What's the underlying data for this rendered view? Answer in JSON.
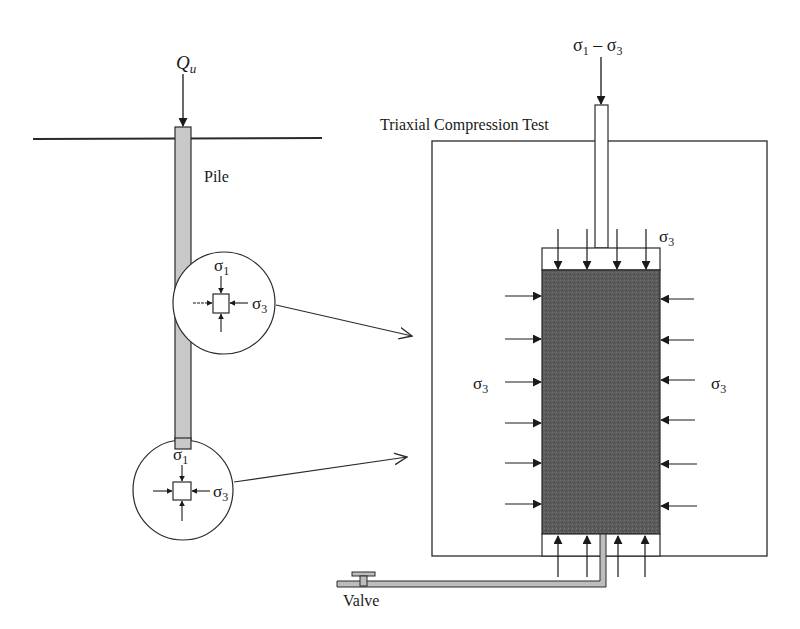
{
  "diagram": {
    "load_label": "Q",
    "load_subscript": "u",
    "pile_label": "Pile",
    "test_title": "Triaxial Compression Test",
    "deviator_label": {
      "s1": "σ",
      "s1_sub": "1",
      "minus": " – ",
      "s3": "σ",
      "s3_sub": "3"
    },
    "sigma": "σ",
    "sub_1": "1",
    "sub_3": "3",
    "valve_label": "Valve",
    "colors": {
      "line": "#2a2a2a",
      "pile_fill": "#c8c8c8",
      "sample_fill": "#585858",
      "pipe_fill": "#bdbdbd",
      "background": "#ffffff"
    },
    "elements": [
      {
        "name": "upper-soil-element",
        "sigma_major": "σ1",
        "sigma_minor": "σ3"
      },
      {
        "name": "lower-soil-element",
        "sigma_major": "σ1",
        "sigma_minor": "σ3"
      }
    ],
    "sample_lateral_label_left": "σ3",
    "sample_lateral_label_right": "σ3",
    "cap_label": "σ3"
  }
}
